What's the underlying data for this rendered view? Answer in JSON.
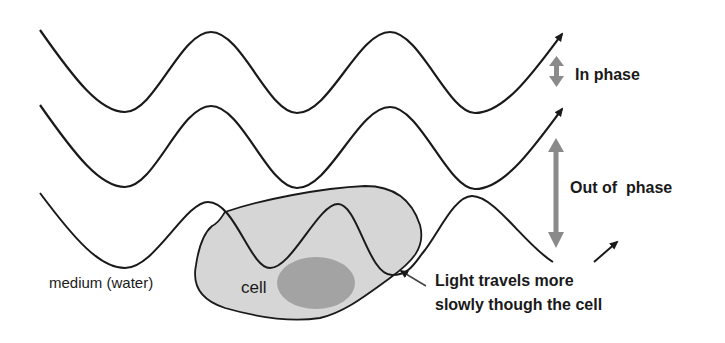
{
  "diagram": {
    "labels": {
      "in_phase": "In phase",
      "out_of_phase": "Out of  phase",
      "medium": "medium (water)",
      "cell": "cell",
      "light_note_line1": "Light travels more",
      "light_note_line2": "slowly though the cell"
    },
    "colors": {
      "wave_stroke": "#1a1a1a",
      "cell_fill": "#d6d6d6",
      "nucleus_fill": "#9a9a9a",
      "phase_arrow": "#8a8a8a",
      "background": "#ffffff"
    },
    "waves": [
      {
        "name": "reference-wave-top",
        "path": "wave passes through medium only"
      },
      {
        "name": "reference-wave-middle",
        "path": "wave passes through medium only"
      },
      {
        "name": "cell-wave-bottom",
        "path": "wave passes through cell, compressed wavelength"
      }
    ]
  }
}
